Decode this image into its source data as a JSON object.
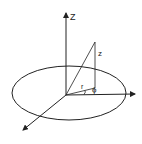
{
  "diagram": {
    "labels": {
      "z_axis": "Z",
      "height": "z",
      "radius": "r",
      "angle": "ϕ"
    },
    "colors": {
      "stroke": "#222222",
      "background": "#ffffff"
    }
  }
}
